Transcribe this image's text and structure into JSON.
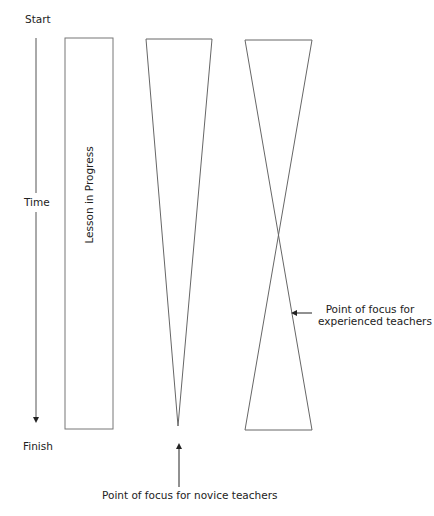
{
  "diagram": {
    "time_axis": {
      "start_label": "Start",
      "middle_label": "Time",
      "end_label": "Finish"
    },
    "lesson_bar": {
      "label": "Lesson in Progress"
    },
    "annotations": {
      "experienced": {
        "line1": "Point of focus for",
        "line2": "experienced teachers"
      },
      "novice": "Point of focus for novice teachers"
    },
    "colors": {
      "stroke": "#555555",
      "text": "#222222"
    }
  }
}
